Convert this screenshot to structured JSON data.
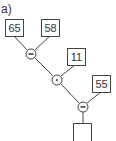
{
  "exercise_label": "a)",
  "inputs": [
    {
      "id": "a",
      "value": "65"
    },
    {
      "id": "b",
      "value": "58"
    },
    {
      "id": "c",
      "value": "11"
    },
    {
      "id": "d",
      "value": "55"
    }
  ],
  "operators": [
    {
      "symbol": "−",
      "name": "minus"
    },
    {
      "symbol": "·",
      "name": "multiply"
    },
    {
      "symbol": "−",
      "name": "minus"
    }
  ],
  "result": {
    "value": ""
  },
  "colors": {
    "line": "#444444",
    "background": "#ffffff"
  }
}
